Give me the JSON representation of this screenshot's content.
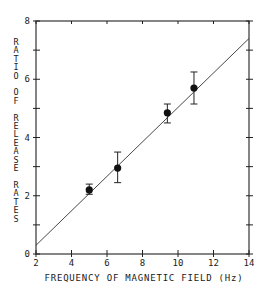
{
  "chart_data": {
    "type": "scatter",
    "title": "",
    "xlabel": "FREQUENCY OF MAGNETIC FIELD (Hz)",
    "ylabel": "RATIO OF RELEASE RATES",
    "xlim": [
      2,
      14
    ],
    "ylim": [
      0,
      8
    ],
    "x_ticks": [
      2,
      4,
      6,
      8,
      10,
      12,
      14
    ],
    "y_ticks": [
      0,
      2,
      4,
      6,
      8
    ],
    "y_minor_ticks": [
      1,
      3,
      5,
      7
    ],
    "grid": false,
    "legend": null,
    "series": [
      {
        "name": "measured",
        "marker": "filled-circle",
        "points": [
          {
            "x": 5.0,
            "y": 2.2,
            "err_low": 2.05,
            "err_high": 2.4
          },
          {
            "x": 6.6,
            "y": 2.95,
            "err_low": 2.45,
            "err_high": 3.5
          },
          {
            "x": 9.4,
            "y": 4.85,
            "err_low": 4.5,
            "err_high": 5.15
          },
          {
            "x": 10.9,
            "y": 5.7,
            "err_low": 5.15,
            "err_high": 6.25
          }
        ]
      },
      {
        "name": "linear fit",
        "type": "line",
        "points": [
          {
            "x": 2,
            "y": 0.3
          },
          {
            "x": 14,
            "y": 7.4
          }
        ]
      }
    ]
  }
}
